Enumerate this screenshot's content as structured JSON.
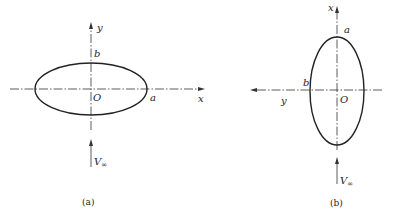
{
  "figures": [
    {
      "id": "a",
      "caption": "(a)",
      "orientation": "major axis horizontal",
      "labels": {
        "vertical_axis": "y",
        "horizontal_axis": "x",
        "origin": "O",
        "semi_major": "a",
        "semi_minor": "b",
        "velocity": "V",
        "velocity_subscript": "∞"
      }
    },
    {
      "id": "b",
      "caption": "(b)",
      "orientation": "major axis vertical",
      "labels": {
        "vertical_axis": "x",
        "horizontal_axis": "y",
        "origin": "O",
        "semi_major": "a",
        "semi_minor": "b",
        "velocity": "V",
        "velocity_subscript": "∞"
      }
    }
  ],
  "colors": {
    "line": "#222222",
    "background": "#ffffff"
  }
}
